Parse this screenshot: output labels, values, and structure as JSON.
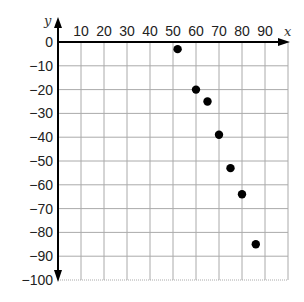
{
  "chart_data": {
    "type": "scatter",
    "title": "",
    "xlabel": "x",
    "ylabel": "y",
    "xlim": [
      0,
      100
    ],
    "ylim": [
      -100,
      0
    ],
    "x_ticks": [
      10,
      20,
      30,
      40,
      50,
      60,
      70,
      80,
      90
    ],
    "y_ticks": [
      0,
      -10,
      -20,
      -30,
      -40,
      -50,
      -60,
      -70,
      -80,
      -90,
      -100
    ],
    "x_tick_labels": [
      "10",
      "20",
      "30",
      "40",
      "50",
      "60",
      "70",
      "80",
      "90"
    ],
    "y_tick_labels": [
      "0",
      "−10",
      "−20",
      "−30",
      "−40",
      "−50",
      "−60",
      "−70",
      "−80",
      "−90",
      "−100"
    ],
    "grid": true,
    "legend": null,
    "series": [
      {
        "name": "points",
        "color": "#000000",
        "points": [
          {
            "x": 52,
            "y": -3
          },
          {
            "x": 60,
            "y": -20
          },
          {
            "x": 65,
            "y": -25
          },
          {
            "x": 70,
            "y": -39
          },
          {
            "x": 75,
            "y": -53
          },
          {
            "x": 80,
            "y": -64
          },
          {
            "x": 86,
            "y": -85
          }
        ]
      }
    ]
  },
  "style": {
    "grid_color": "#aaaaaa",
    "axis_color": "#000000",
    "point_color": "#000000"
  }
}
